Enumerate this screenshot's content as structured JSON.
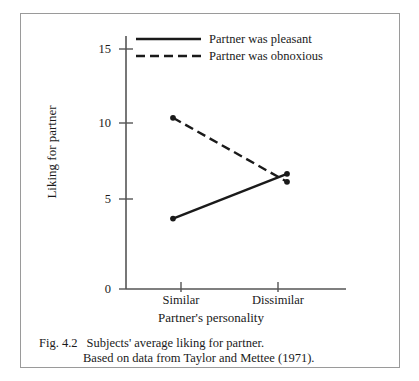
{
  "chart_data": {
    "type": "line",
    "title": "",
    "xlabel": "Partner's personality",
    "ylabel": "Liking for partner",
    "categories": [
      "Similar",
      "Dissimilar"
    ],
    "ylim": [
      0,
      16
    ],
    "yticks": [
      0,
      5,
      10,
      15
    ],
    "ytick_labels": [
      "0",
      "5",
      "10",
      "15"
    ],
    "grid": false,
    "legend_position": "top-left-inside",
    "series": [
      {
        "name": "Partner was pleasant",
        "style": "solid",
        "values": [
          4.4,
          7.2
        ]
      },
      {
        "name": "Partner was obnoxious",
        "style": "dashed",
        "values": [
          10.7,
          6.7
        ]
      }
    ]
  },
  "axes": {
    "y_tick_0": "0",
    "y_tick_5": "5",
    "y_tick_10": "10",
    "y_tick_15": "15",
    "x_tick_1": "Similar",
    "x_tick_2": "Dissimilar",
    "y_title": "Liking for partner",
    "x_title": "Partner's personality"
  },
  "legend": {
    "item_1": "Partner was pleasant",
    "item_2": "Partner was obnoxious"
  },
  "caption": {
    "figure_number": "Fig. 4.2",
    "line_1": "Subjects' average liking for partner.",
    "line_2": "Based on data from Taylor and Mettee (1971)."
  },
  "colors": {
    "ink": "#1a1a1a",
    "axis": "#555555",
    "border": "#9a9a9a",
    "background": "#ffffff"
  }
}
